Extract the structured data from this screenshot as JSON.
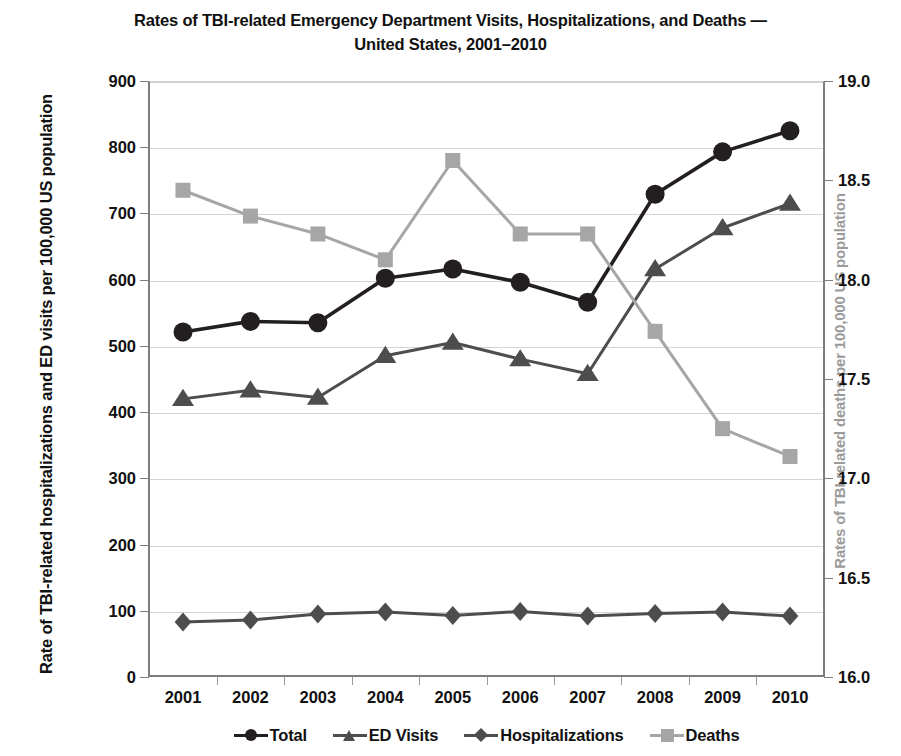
{
  "chart_data": {
    "type": "line",
    "title": "Rates of TBI-related Emergency Department Visits, Hospitalizations, and Deaths — United States, 2001–2010",
    "title_line1": "Rates of TBI-related Emergency Department Visits, Hospitalizations, and Deaths —",
    "title_line2": "United States, 2001–2010",
    "xlabel": "",
    "ylabel": "Rate of TBI-related hospitalizations and ED visits per 100,000 US population",
    "y2label": "Rates of TBI-related deaths per 100,000 US population",
    "categories": [
      "2001",
      "2002",
      "2003",
      "2004",
      "2005",
      "2006",
      "2007",
      "2008",
      "2009",
      "2010"
    ],
    "x": [
      2001,
      2002,
      2003,
      2004,
      2005,
      2006,
      2007,
      2008,
      2009,
      2010
    ],
    "ylim": [
      0,
      900
    ],
    "ytick_step": 100,
    "yticks": [
      "0",
      "100",
      "200",
      "300",
      "400",
      "500",
      "600",
      "700",
      "800",
      "900"
    ],
    "y2lim": [
      16.0,
      19.0
    ],
    "y2tick_step": 0.5,
    "y2ticks": [
      "16.0",
      "16.5",
      "17.0",
      "17.5",
      "18.0",
      "18.5",
      "19.0"
    ],
    "grid": true,
    "legend_position": "bottom",
    "series": [
      {
        "name": "Total",
        "axis": "left",
        "marker": "circle",
        "color": "#231f20",
        "values": [
          521,
          537,
          535,
          602,
          616,
          596,
          566,
          729,
          793,
          825
        ]
      },
      {
        "name": "ED Visits",
        "axis": "left",
        "marker": "triangle",
        "color": "#4d4d4d",
        "values": [
          420,
          433,
          422,
          485,
          505,
          480,
          458,
          616,
          678,
          715
        ]
      },
      {
        "name": "Hospitalizations",
        "axis": "left",
        "marker": "diamond",
        "color": "#4d4d4d",
        "values": [
          83,
          86,
          95,
          98,
          93,
          99,
          92,
          96,
          98,
          92
        ]
      },
      {
        "name": "Deaths",
        "axis": "right",
        "marker": "square",
        "color": "#a6a6a6",
        "values": [
          18.45,
          18.32,
          18.23,
          18.1,
          18.6,
          18.23,
          18.23,
          17.74,
          17.25,
          17.11
        ]
      }
    ]
  },
  "legend": {
    "items": [
      {
        "label": "Total"
      },
      {
        "label": "ED Visits"
      },
      {
        "label": "Hospitalizations"
      },
      {
        "label": "Deaths"
      }
    ]
  },
  "colors": {
    "total": "#231f20",
    "ed_visits": "#4d4d4d",
    "hospitalizations": "#4d4d4d",
    "deaths": "#a6a6a6",
    "axis": "#7d7d7d",
    "grid": "#d4d4d4",
    "right_axis_title": "#9a9a9a"
  }
}
